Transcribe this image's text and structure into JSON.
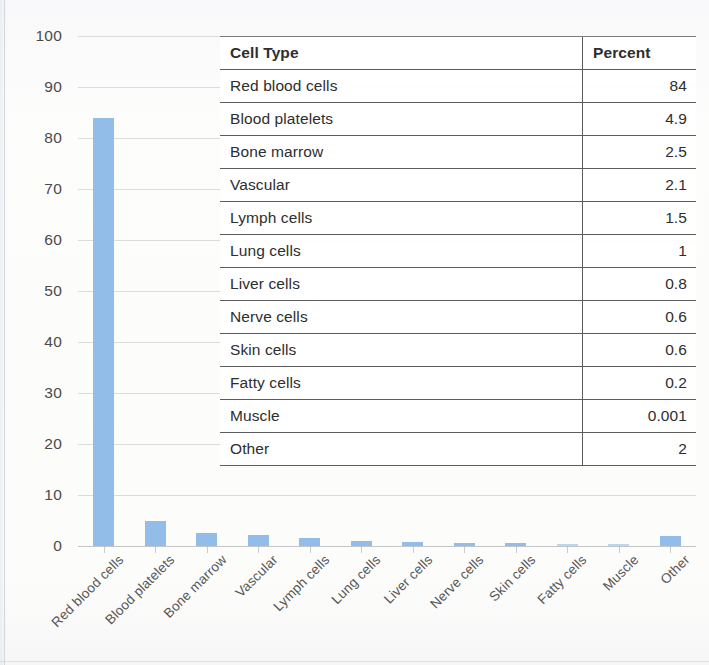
{
  "chart_data": {
    "type": "bar",
    "title": "",
    "xlabel": "",
    "ylabel": "",
    "ylim": [
      0,
      100
    ],
    "ytick_step": 10,
    "yticks": [
      "0",
      "10",
      "20",
      "30",
      "40",
      "50",
      "60",
      "70",
      "80",
      "90",
      "100"
    ],
    "grid": true,
    "legend": false,
    "bar_color": "#92bde9",
    "categories": [
      "Red blood cells",
      "Blood platelets",
      "Bone marrow",
      "Vascular",
      "Lymph cells",
      "Lung cells",
      "Liver cells",
      "Nerve cells",
      "Skin cells",
      "Fatty cells",
      "Muscle",
      "Other"
    ],
    "values": [
      84,
      4.9,
      2.5,
      2.1,
      1.5,
      1,
      0.8,
      0.6,
      0.6,
      0.2,
      0.001,
      2
    ]
  },
  "table": {
    "headers": [
      "Cell Type",
      "Percent"
    ],
    "rows": [
      {
        "cell_type": "Red blood cells",
        "percent": "84"
      },
      {
        "cell_type": "Blood platelets",
        "percent": "4.9"
      },
      {
        "cell_type": "Bone marrow",
        "percent": "2.5"
      },
      {
        "cell_type": "Vascular",
        "percent": "2.1"
      },
      {
        "cell_type": "Lymph cells",
        "percent": "1.5"
      },
      {
        "cell_type": "Lung cells",
        "percent": "1"
      },
      {
        "cell_type": "Liver cells",
        "percent": "0.8"
      },
      {
        "cell_type": "Nerve cells",
        "percent": "0.6"
      },
      {
        "cell_type": "Skin cells",
        "percent": "0.6"
      },
      {
        "cell_type": "Fatty cells",
        "percent": "0.2"
      },
      {
        "cell_type": "Muscle",
        "percent": "0.001"
      },
      {
        "cell_type": "Other",
        "percent": "2"
      }
    ]
  }
}
